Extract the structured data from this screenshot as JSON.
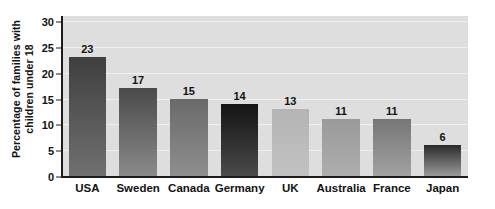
{
  "chart_data": {
    "type": "bar",
    "title": "",
    "subtitle": "",
    "xlabel": "",
    "ylabel": "Percentage of families with children under 18",
    "ylabel_lines": [
      "Percentage of families with",
      "children under 18"
    ],
    "categories": [
      "USA",
      "Sweden",
      "Canada",
      "Germany",
      "UK",
      "Australia",
      "France",
      "Japan"
    ],
    "values": [
      23,
      17,
      15,
      14,
      13,
      11,
      11,
      6
    ],
    "data_labels": [
      "23",
      "17",
      "15",
      "14",
      "13",
      "11",
      "11",
      "6"
    ],
    "ylim": [
      0,
      31
    ],
    "y_ticks": [
      0,
      5,
      10,
      15,
      20,
      25,
      30
    ],
    "y_tick_labels": [
      "0",
      "5",
      "10",
      "15",
      "20",
      "25",
      "30"
    ],
    "grid": true,
    "grid_axis": "y",
    "legend": false,
    "legend_position": "none",
    "bar_colors_top": [
      "#3f3f3f",
      "#4a4a4a",
      "#6a6a6a",
      "#141414",
      "#b4b4b4",
      "#9a9a9a",
      "#767676",
      "#2a2a2a"
    ],
    "bar_colors_bottom": [
      "#707070",
      "#8a8a8a",
      "#8e8e8e",
      "#4a4a4a",
      "#c2c2c2",
      "#aeaeae",
      "#a2a2a2",
      "#9a9a9a"
    ],
    "plot_background": "#dedede",
    "gridline_color": "#f0f0f0",
    "axis_color": "#1c1c1c",
    "text_color": "#121212",
    "figure_background": "#ffffff"
  }
}
